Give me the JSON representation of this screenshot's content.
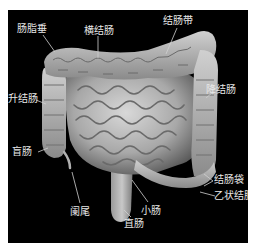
{
  "diagram": {
    "background_color": "#000000",
    "organ_color": "#bdbdbd",
    "label_color": "#e8e8e8",
    "labels": {
      "epiploic_appendages": "肠脂垂",
      "transverse_colon": "横结肠",
      "taenia_coli": "结肠带",
      "ascending_colon": "升结肠",
      "descending_colon": "降结肠",
      "cecum": "盲肠",
      "haustra": "结肠袋",
      "sigmoid_colon": "乙状结肠",
      "appendix": "阑尾",
      "small_intestine": "小肠",
      "rectum": "直肠"
    }
  }
}
